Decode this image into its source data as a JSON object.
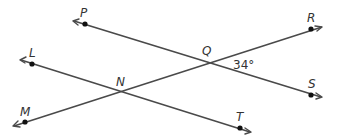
{
  "diagram": {
    "type": "geometry-lines",
    "colors": {
      "line": "#4a4a4a",
      "point": "#111111",
      "text": "#333333",
      "background": "#ffffff"
    },
    "points": {
      "P": {
        "label": "P",
        "x": 85,
        "y": 24
      },
      "S": {
        "label": "S",
        "x": 311,
        "y": 95
      },
      "L": {
        "label": "L",
        "x": 32,
        "y": 64
      },
      "T": {
        "label": "T",
        "x": 240,
        "y": 128
      },
      "M": {
        "label": "M",
        "x": 25,
        "y": 122
      },
      "R": {
        "label": "R",
        "x": 311,
        "y": 29
      },
      "Q": {
        "label": "Q",
        "x": 211,
        "y": 61
      },
      "N": {
        "label": "N",
        "x": 121,
        "y": 92
      }
    },
    "lines": [
      {
        "name": "line-PS",
        "through": [
          "P",
          "Q",
          "S"
        ]
      },
      {
        "name": "line-LT",
        "through": [
          "L",
          "N",
          "T"
        ]
      },
      {
        "name": "line-MR",
        "through": [
          "M",
          "N",
          "Q",
          "R"
        ]
      }
    ],
    "angle": {
      "vertex": "Q",
      "between": [
        "R",
        "S"
      ],
      "label": "34°",
      "value": 34
    }
  }
}
